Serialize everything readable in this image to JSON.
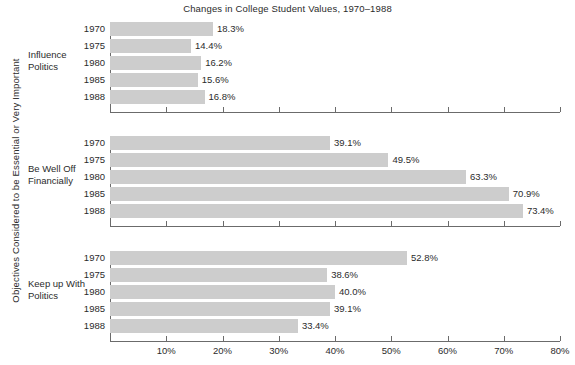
{
  "chart_data": {
    "type": "bar",
    "orientation": "horizontal",
    "title": "Changes in College Student Values, 1970–1988",
    "xlabel": "",
    "ylabel": "Objectives Considered to be Essential or Very Important",
    "xlim": [
      0,
      80
    ],
    "xticks": [
      0,
      10,
      20,
      30,
      40,
      50,
      60,
      70,
      80
    ],
    "xticklabels": [
      "",
      "10%",
      "20%",
      "30%",
      "40%",
      "50%",
      "60%",
      "70%",
      "80%"
    ],
    "grid": false,
    "legend": false,
    "bar_color": "#cdcdcd",
    "categories": [
      "1970",
      "1975",
      "1980",
      "1985",
      "1988"
    ],
    "panels": [
      {
        "label": "Influence\nPolitics",
        "label_line1": "Influence",
        "label_line2": "Politics",
        "values": [
          18.3,
          14.4,
          16.2,
          15.6,
          16.8
        ],
        "value_labels": [
          "18.3%",
          "14.4%",
          "16.2%",
          "15.6%",
          "16.8%"
        ]
      },
      {
        "label": "Be Well Off\nFinancially",
        "label_line1": "Be Well Off",
        "label_line2": "Financially",
        "values": [
          39.1,
          49.5,
          63.3,
          70.9,
          73.4
        ],
        "value_labels": [
          "39.1%",
          "49.5%",
          "63.3%",
          "70.9%",
          "73.4%"
        ]
      },
      {
        "label": "Keep up With\nPolitics",
        "label_line1": "Keep up With",
        "label_line2": "Politics",
        "values": [
          52.8,
          38.6,
          40.0,
          39.1,
          33.4
        ],
        "value_labels": [
          "52.8%",
          "38.6%",
          "40.0%",
          "39.1%",
          "33.4%"
        ]
      }
    ]
  }
}
